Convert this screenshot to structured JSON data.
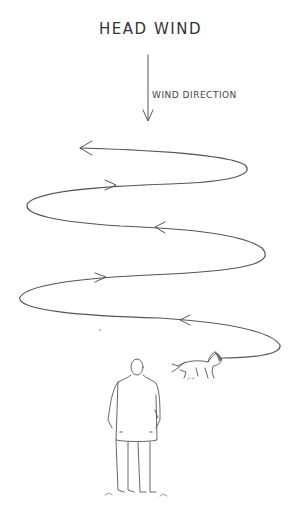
{
  "diagram": {
    "title": "HEAD WIND",
    "wind_label": "WIND DIRECTION",
    "elements": {
      "wind_arrow": "wind-direction-arrow",
      "path": "zigzag-search-path",
      "dog": "dog-figure",
      "person": "person-figure"
    },
    "colors": {
      "ink": "#555555",
      "background": "#ffffff"
    }
  }
}
